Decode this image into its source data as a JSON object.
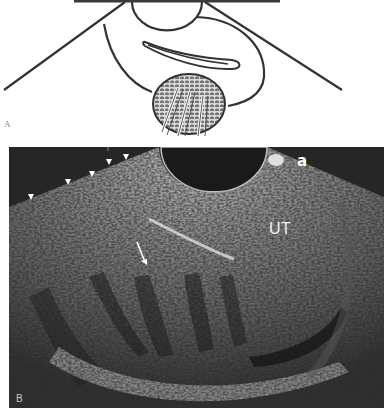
{
  "figure": {
    "panel_a": {
      "label": "A",
      "description": "Schematic line drawing: transducer probe (semicircle) at top with converging beam lines, an elongated loop structure, and a textured circular mass with arrows pointing into it"
    },
    "panel_b": {
      "label": "B",
      "description": "Ultrasound image, grayscale, with probe footprint semicircle at top",
      "annotations": {
        "corner_label": "a",
        "organ_label": "UT",
        "arrowheads_count": 5,
        "arrow_count": 1
      }
    }
  },
  "colors": {
    "line_drawing": "#333333",
    "ultrasound_bg": "#2a2a2a",
    "ultrasound_bright": "#e8e8e8",
    "annotation_text": "#ffffff"
  }
}
